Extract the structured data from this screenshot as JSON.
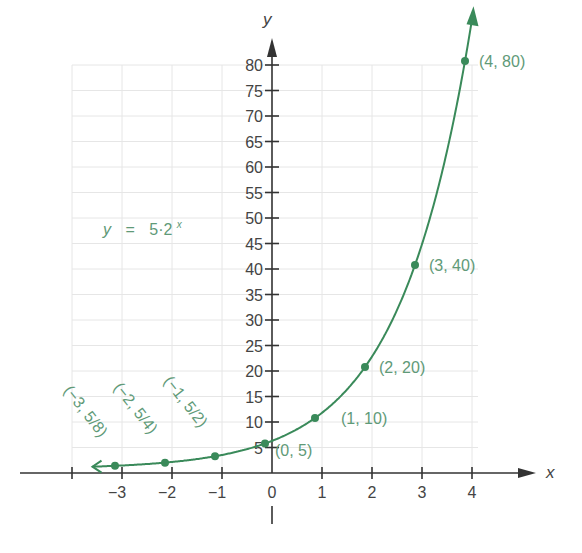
{
  "chart_data": {
    "type": "line",
    "title": "",
    "equation": "y = 5·2^x",
    "equation_label": {
      "y": "y",
      "eq": "=",
      "base": "5·2",
      "exp": "x"
    },
    "xlabel": "x",
    "ylabel": "y",
    "xlim": [
      -4,
      4
    ],
    "ylim": [
      0,
      80
    ],
    "x_ticks": [
      -3,
      -2,
      -1,
      0,
      1,
      2,
      3,
      4
    ],
    "x_tick_labels": [
      "−3",
      "−2",
      "−1",
      "0",
      "1",
      "2",
      "3",
      "4"
    ],
    "y_ticks": [
      5,
      10,
      15,
      20,
      25,
      30,
      35,
      40,
      45,
      50,
      55,
      60,
      65,
      70,
      75,
      80
    ],
    "y_tick_labels": [
      "5",
      "10",
      "15",
      "20",
      "25",
      "30",
      "35",
      "40",
      "45",
      "50",
      "55",
      "60",
      "65",
      "70",
      "75",
      "80"
    ],
    "grid": true,
    "legend": null,
    "series": [
      {
        "name": "y = 5·2^x",
        "color": "#3a8a5a",
        "points": [
          {
            "x": -3,
            "y": 0.625,
            "label": "(−3, 5/8)"
          },
          {
            "x": -2,
            "y": 1.25,
            "label": "(−2, 5/4)"
          },
          {
            "x": -1,
            "y": 2.5,
            "label": "(−1, 5/2)"
          },
          {
            "x": 0,
            "y": 5,
            "label": "(0, 5)"
          },
          {
            "x": 1,
            "y": 10,
            "label": "(1, 10)"
          },
          {
            "x": 2,
            "y": 20,
            "label": "(2, 20)"
          },
          {
            "x": 3,
            "y": 40,
            "label": "(3, 40)"
          },
          {
            "x": 4,
            "y": 80,
            "label": "(4, 80)"
          }
        ]
      }
    ]
  },
  "colors": {
    "curve": "#3a8a5a",
    "label": "#5f9a78",
    "axis": "#333333",
    "grid": "#e6e6e6"
  }
}
